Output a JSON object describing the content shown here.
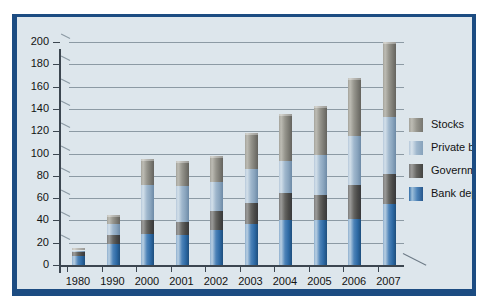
{
  "chart_data": {
    "type": "bar",
    "subtype": "stacked-column",
    "title": "",
    "xlabel": "",
    "ylabel": "",
    "ylim": [
      0,
      200
    ],
    "yticks": [
      0,
      20,
      40,
      60,
      80,
      100,
      120,
      140,
      160,
      180,
      200
    ],
    "grid": true,
    "legend_position": "right",
    "categories": [
      "1980",
      "1990",
      "2000",
      "2001",
      "2002",
      "2003",
      "2004",
      "2005",
      "2006",
      "2007"
    ],
    "series": [
      {
        "name": "Bank deposits",
        "color": "#4d83b8",
        "values": [
          8,
          19,
          28,
          27,
          31,
          37,
          40,
          40,
          41,
          55
        ]
      },
      {
        "name": "Government bonds",
        "color": "#646461",
        "values": [
          4,
          8,
          12,
          12,
          17,
          19,
          25,
          23,
          31,
          27
        ]
      },
      {
        "name": "Private bonds",
        "color": "#9fb7cd",
        "values": [
          1,
          10,
          32,
          32,
          26,
          30,
          28,
          36,
          44,
          51
        ]
      },
      {
        "name": "Stocks",
        "color": "#96958d",
        "values": [
          2,
          8,
          23,
          22,
          24,
          32,
          42,
          44,
          52,
          67
        ]
      }
    ],
    "totals": [
      15,
      45,
      95,
      93,
      98,
      118,
      135,
      143,
      168,
      200
    ]
  },
  "legend": {
    "entries": [
      {
        "label": "Stocks",
        "swatch": "stocks"
      },
      {
        "label": "Private bonds",
        "swatch": "private"
      },
      {
        "label": "Government bonds",
        "swatch": "gov"
      },
      {
        "label": "Bank deposits",
        "swatch": "deposits"
      }
    ]
  },
  "colors": {
    "panel_background": "#dde6ec",
    "frame_shadow": "#1c4c82",
    "gridline": "#8c9aa4",
    "axis": "#3c4650",
    "text": "#131313"
  }
}
